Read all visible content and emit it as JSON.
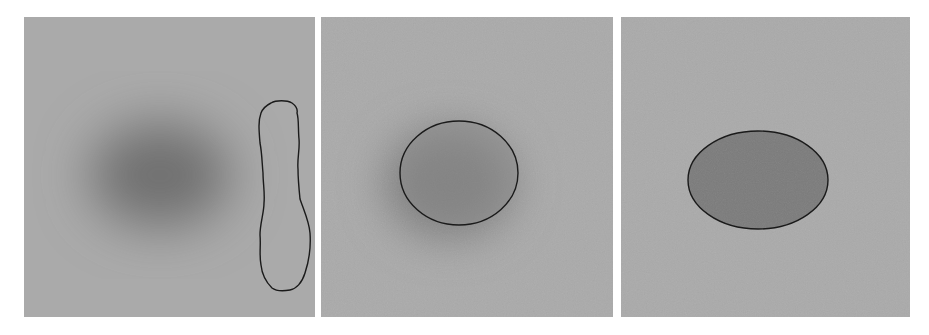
{
  "figure": {
    "panel_count": 3,
    "background_color": "#ffffff",
    "panels": [
      {
        "id": "panel-1",
        "description": "Noisy gray image with blurred dark elliptical blob; segmentation contour (bone-shaped) placed to the right, missing the object",
        "background_color": "#a9a9a9",
        "blob": {
          "cx": 136,
          "cy": 158,
          "rx": 78,
          "ry": 62,
          "color": "#7e7e7e",
          "blurred": true
        },
        "contour": {
          "shape": "irregular-elongated",
          "color": "#1a1a1a",
          "bbox": {
            "x": 234,
            "y": 84,
            "w": 53,
            "h": 189
          }
        }
      },
      {
        "id": "panel-2",
        "description": "Noisy gray image with blurred dark blob; elliptical segmentation contour partially capturing the object",
        "background_color": "#a9a9a9",
        "blob": {
          "cx": 132,
          "cy": 160,
          "rx": 72,
          "ry": 62,
          "color": "#858585",
          "blurred": true
        },
        "contour": {
          "shape": "ellipse",
          "color": "#1a1a1a",
          "cx": 138,
          "cy": 156,
          "rx": 59,
          "ry": 52,
          "fill": "#8c8c8c"
        }
      },
      {
        "id": "panel-3",
        "description": "Gray image with sharp-edged darker ellipse; segmentation contour tightly aligned to object boundary",
        "background_color": "#a9a9a9",
        "contour": {
          "shape": "ellipse",
          "color": "#1a1a1a",
          "cx": 137,
          "cy": 163,
          "rx": 70,
          "ry": 49,
          "fill": "#7a7a7a"
        }
      }
    ]
  }
}
